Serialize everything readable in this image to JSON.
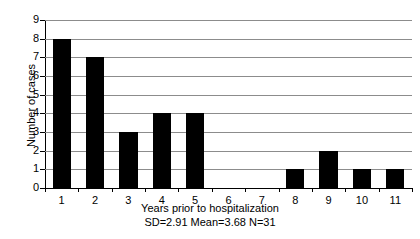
{
  "chart_data": {
    "type": "bar",
    "title": "",
    "categories": [
      "1",
      "2",
      "3",
      "4",
      "5",
      "6",
      "7",
      "8",
      "9",
      "10",
      "11"
    ],
    "values": [
      8,
      7,
      3,
      4,
      4,
      0,
      0,
      1,
      2,
      1,
      1
    ],
    "xlabel": "Years prior to hospitalization",
    "ylabel": "Number of cases",
    "ylim": [
      0,
      9
    ],
    "yticks": [
      "0",
      "1",
      "2",
      "3",
      "4",
      "5",
      "6",
      "7",
      "8",
      "9"
    ],
    "grid": true,
    "legend": false,
    "bar_color": "#000000",
    "grid_color": "#8c8c8c",
    "annotation": "SD=2.91 Mean=3.68 N=31",
    "statistics": {
      "sd": "2.91",
      "mean": "3.68",
      "n": "31"
    }
  }
}
